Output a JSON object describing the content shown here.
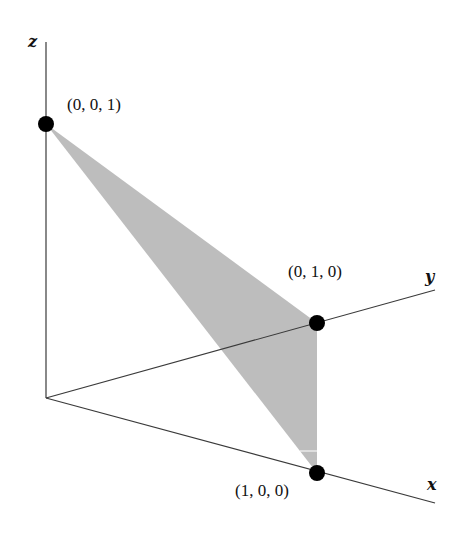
{
  "diagram": {
    "axes": {
      "x": {
        "label": "x"
      },
      "y": {
        "label": "y"
      },
      "z": {
        "label": "z"
      }
    },
    "points": [
      {
        "id": "z-intercept",
        "label": "(0, 0, 1)"
      },
      {
        "id": "y-intercept",
        "label": "(0, 1, 0)"
      },
      {
        "id": "x-intercept",
        "label": "(1, 0, 0)"
      }
    ],
    "colors": {
      "plane": "#bdbdbd",
      "axes": "#3a3a3a",
      "points": "#000000"
    }
  }
}
